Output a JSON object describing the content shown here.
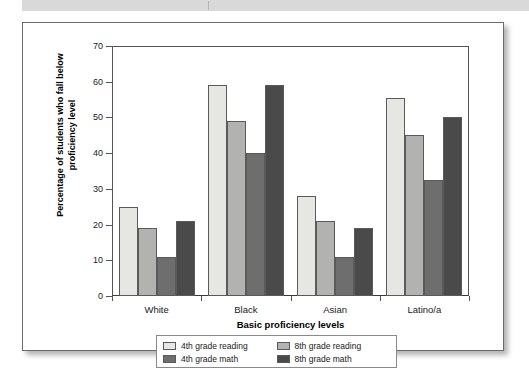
{
  "page": {
    "header_band_present": true
  },
  "figure": {
    "background": "#ffffff",
    "border_color": "#6b6b6b"
  },
  "chart_data": {
    "type": "bar",
    "title": "",
    "xlabel": "Basic proficiency levels",
    "ylabel": "Percentage of students who fall below proficiency level",
    "categories": [
      "White",
      "Black",
      "Asian",
      "Latino/a"
    ],
    "ylim": [
      0,
      70
    ],
    "yticks": [
      0,
      10,
      20,
      30,
      40,
      50,
      60,
      70
    ],
    "ytick_labels": [
      "0",
      "10",
      "20",
      "30",
      "40",
      "50",
      "60",
      "70"
    ],
    "grid": false,
    "legend_position": "below-axes",
    "series": [
      {
        "name": "4th grade reading",
        "color": "#e6e6e3",
        "values": [
          25,
          59,
          28,
          55.5
        ]
      },
      {
        "name": "8th grade reading",
        "color": "#b2b2b0",
        "values": [
          19,
          49,
          21,
          45
        ]
      },
      {
        "name": "4th grade math",
        "color": "#6e6e6e",
        "values": [
          11,
          40,
          11,
          32.5
        ]
      },
      {
        "name": "8th grade math",
        "color": "#4a4a4a",
        "values": [
          21,
          59,
          19,
          50
        ]
      }
    ]
  }
}
